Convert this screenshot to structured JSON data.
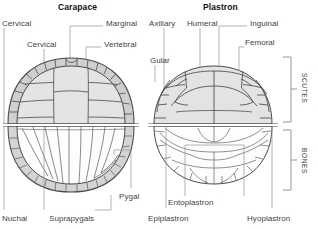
{
  "figure": {
    "titles": [
      {
        "text": "Carapace",
        "x": 58,
        "y": 2
      },
      {
        "text": "Plastron",
        "x": 203,
        "y": 2
      }
    ],
    "labels": [
      {
        "name": "cervical-scute-label",
        "text": "Cervical",
        "x": 2,
        "y": 19
      },
      {
        "name": "cervical-bone-label",
        "text": "Cervical",
        "x": 27,
        "y": 40
      },
      {
        "name": "marginal-label",
        "text": "Marginal",
        "x": 106,
        "y": 19
      },
      {
        "name": "vertebral-label",
        "text": "Vertebral",
        "x": 104,
        "y": 40
      },
      {
        "name": "axillary-label",
        "text": "Axillary",
        "x": 149,
        "y": 19
      },
      {
        "name": "humeral-label",
        "text": "Humeral",
        "x": 187,
        "y": 19
      },
      {
        "name": "inguinal-label",
        "text": "Inguinal",
        "x": 250,
        "y": 19
      },
      {
        "name": "gular-label",
        "text": "Gular",
        "x": 150,
        "y": 56
      },
      {
        "name": "femoral-label",
        "text": "Femoral",
        "x": 245,
        "y": 38
      },
      {
        "name": "pygal-label",
        "text": "Pygal",
        "x": 119,
        "y": 192
      },
      {
        "name": "nuchal-label",
        "text": "Nuchal",
        "x": 2,
        "y": 214
      },
      {
        "name": "suprapygals-label",
        "text": "Suprapygals",
        "x": 49,
        "y": 214
      },
      {
        "name": "entoplastron-label",
        "text": "Entoplastron",
        "x": 168,
        "y": 198
      },
      {
        "name": "epiplastron-label",
        "text": "Epiplastron",
        "x": 148,
        "y": 214
      },
      {
        "name": "hyoplastron-label",
        "text": "Hyoplastron",
        "x": 247,
        "y": 214
      }
    ],
    "bracket_labels": [
      {
        "name": "scutes-bracket-label",
        "text": "SCUTES",
        "x": 308,
        "y": 73
      },
      {
        "name": "bones-bracket-label",
        "text": "BONES",
        "x": 308,
        "y": 148
      }
    ],
    "colors": {
      "shell_fill": "#d6d6d6",
      "scute_fill": "#e2e2e2",
      "bone_fill": "#fefefe",
      "outline": "#4a4a4a",
      "leader": "#8e8e8e",
      "text": "#3f3f3f",
      "title": "#121212",
      "background": "#ffffff"
    },
    "panels": [
      {
        "name": "carapace-scutes-panel",
        "region": "top-left"
      },
      {
        "name": "carapace-bones-panel",
        "region": "bottom-left"
      },
      {
        "name": "plastron-scutes-panel",
        "region": "top-right"
      },
      {
        "name": "plastron-bones-panel",
        "region": "bottom-right"
      }
    ]
  }
}
